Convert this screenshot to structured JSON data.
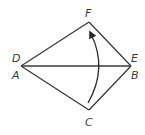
{
  "diagram": {
    "colors": {
      "stroke": "#3a3a3a",
      "label": "#3a3a3a",
      "background": "#ffffff"
    },
    "points": {
      "left": {
        "x": 21,
        "y": 66
      },
      "right": {
        "x": 131,
        "y": 66
      },
      "top": {
        "x": 89,
        "y": 22
      },
      "bottom": {
        "x": 89,
        "y": 110
      }
    },
    "labels": {
      "D": "D",
      "A": "A",
      "E": "E",
      "B": "B",
      "F": "F",
      "C": "C"
    },
    "arrow": {
      "from": "C",
      "to": "F",
      "icon": "curved-arrow-icon"
    }
  }
}
